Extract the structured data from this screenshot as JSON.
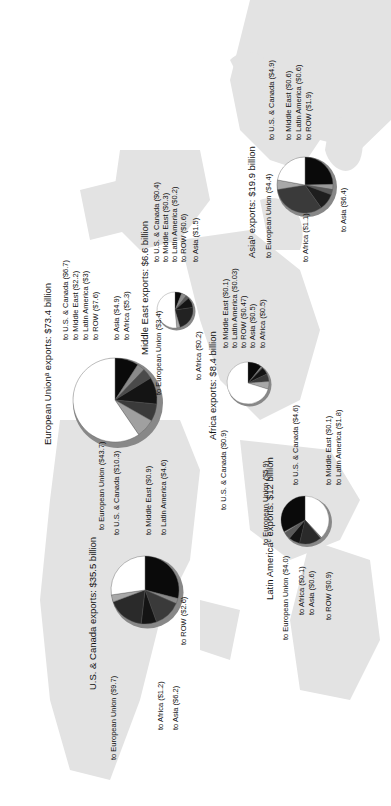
{
  "chart_data": {
    "type": "pie",
    "charts": [
      {
        "region": "Asia",
        "title": "Asiaᵇ exports: $19.9 billion",
        "total": 19.9,
        "slices": [
          {
            "label": "to U.S. & Canada ($4.9)",
            "value": 4.9,
            "color": "#0a0a0a"
          },
          {
            "label": "to Middle East ($0.6)",
            "value": 0.6,
            "color": "#9a9a9a"
          },
          {
            "label": "to Latin America ($0.6)",
            "value": 0.6,
            "color": "#5a5a5a"
          },
          {
            "label": "to ROW ($1.9)",
            "value": 1.9,
            "color": "#1e1e1e"
          },
          {
            "label": "to Asia ($6.4)",
            "value": 6.4,
            "color": "#3a3a3a"
          },
          {
            "label": "to Africa ($1.1)",
            "value": 1.1,
            "color": "#a8a8a8"
          },
          {
            "label": "to European Union ($4.4)",
            "value": 4.4,
            "color": "#ffffff"
          }
        ]
      },
      {
        "region": "European Union",
        "title": "European Unionᵃ exports: $73.4 billion",
        "total": 73.4,
        "slices": [
          {
            "label": "to U.S. & Canada ($6.7)",
            "value": 6.7,
            "color": "#0a0a0a"
          },
          {
            "label": "to Middle East ($2.2)",
            "value": 2.2,
            "color": "#8a8a8a"
          },
          {
            "label": "to Latin America ($3)",
            "value": 3,
            "color": "#4a4a4a"
          },
          {
            "label": "to ROW ($7.6)",
            "value": 7.6,
            "color": "#141414"
          },
          {
            "label": "to Asia ($4.9)",
            "value": 4.9,
            "color": "#3a3a3a"
          },
          {
            "label": "to Africa ($5.3)",
            "value": 5.3,
            "color": "#a0a0a0"
          },
          {
            "label": "to European Union ($43.7)",
            "value": 43.7,
            "color": "#ffffff"
          }
        ]
      },
      {
        "region": "Middle East",
        "title": "Middle East exports: $6.6 billion",
        "total": 6.6,
        "slices": [
          {
            "label": "to U.S. & Canada ($0.4)",
            "value": 0.4,
            "color": "#0a0a0a"
          },
          {
            "label": "to Middle East ($0.3)",
            "value": 0.3,
            "color": "#8a8a8a"
          },
          {
            "label": "to Latin America ($0.2)",
            "value": 0.2,
            "color": "#5a5a5a"
          },
          {
            "label": "to ROW ($0.6)",
            "value": 0.6,
            "color": "#141414"
          },
          {
            "label": "to Asia ($1.5)",
            "value": 1.5,
            "color": "#222222"
          },
          {
            "label": "to Africa ($0.2)",
            "value": 0.2,
            "color": "#a8a8a8"
          },
          {
            "label": "to European Union ($3.4)",
            "value": 3.4,
            "color": "#ffffff"
          }
        ]
      },
      {
        "region": "Africa",
        "title": "Africa exports: $8.4 billion",
        "total": 8.4,
        "slices": [
          {
            "label": "to U.S. & Canada ($0.9)",
            "value": 0.9,
            "color": "#0a0a0a"
          },
          {
            "label": "to Middle East ($0.1)",
            "value": 0.1,
            "color": "#8a8a8a"
          },
          {
            "label": "to Latin America ($0.03)",
            "value": 0.03,
            "color": "#5a5a5a"
          },
          {
            "label": "to ROW ($0.47)",
            "value": 0.47,
            "color": "#141414"
          },
          {
            "label": "to Asia ($0.5)",
            "value": 0.5,
            "color": "#3a3a3a"
          },
          {
            "label": "to Africa ($0.5)",
            "value": 0.5,
            "color": "#a8a8a8"
          },
          {
            "label": "to European Union ($5.9)",
            "value": 5.9,
            "color": "#ffffff"
          }
        ]
      },
      {
        "region": "Latin America",
        "title": "Latin Americaᶜ exports: $12 billion",
        "total": 12,
        "slices": [
          {
            "label": "to U.S. & Canada ($4.6)",
            "value": 4.6,
            "color": "#ffffff"
          },
          {
            "label": "to Middle East ($0.1)",
            "value": 0.1,
            "color": "#8a8a8a"
          },
          {
            "label": "to Latin America ($1.8)",
            "value": 1.8,
            "color": "#2a2a2a"
          },
          {
            "label": "to ROW ($0.9)",
            "value": 0.9,
            "color": "#141414"
          },
          {
            "label": "to Asia ($0.6)",
            "value": 0.6,
            "color": "#5a5a5a"
          },
          {
            "label": "to Africa ($0.1)",
            "value": 0.1,
            "color": "#a8a8a8"
          },
          {
            "label": "to European Union ($4.0)",
            "value": 4.0,
            "color": "#0a0a0a"
          }
        ]
      },
      {
        "region": "U.S. & Canada",
        "title": "U.S. & Canada exports: $35.5 billion",
        "total": 35.5,
        "slices": [
          {
            "label": "to U.S. & Canada ($10.3)",
            "value": 10.3,
            "color": "#0a0a0a"
          },
          {
            "label": "to Middle East ($0.9)",
            "value": 0.9,
            "color": "#8a8a8a"
          },
          {
            "label": "to Latin America ($4.6)",
            "value": 4.6,
            "color": "#3a3a3a"
          },
          {
            "label": "to ROW ($2.6)",
            "value": 2.6,
            "color": "#141414"
          },
          {
            "label": "to Asia ($6.2)",
            "value": 6.2,
            "color": "#2a2a2a"
          },
          {
            "label": "to Africa ($1.2)",
            "value": 1.2,
            "color": "#a8a8a8"
          },
          {
            "label": "to European Union ($9.7)",
            "value": 9.7,
            "color": "#ffffff"
          }
        ]
      }
    ]
  },
  "colors": {
    "land": "#e3e3e3",
    "background": "#ffffff",
    "text": "#111111"
  }
}
